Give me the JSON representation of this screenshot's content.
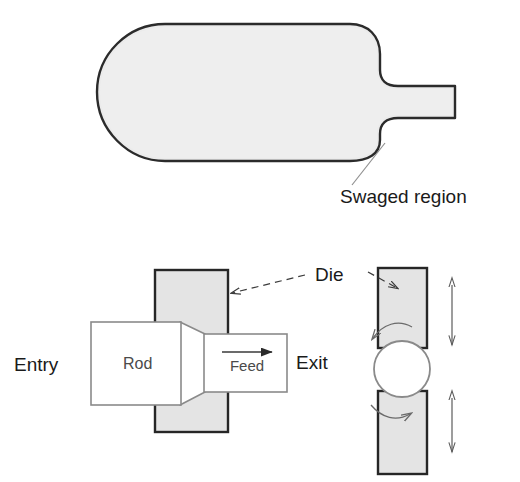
{
  "figure": {
    "colors": {
      "workpiece_fill": "#ebebeb",
      "workpiece_stroke": "#2b2b2b",
      "die_fill": "#e4e4e4",
      "die_stroke": "#262626",
      "rod_fill": "#ffffff",
      "rod_stroke": "#8a8a8a",
      "leader_line": "#8e8e8e",
      "text": "#1a1a1a",
      "background": "#ffffff"
    }
  },
  "top_figure": {
    "name": "swaged-workpiece",
    "labels": {
      "swaged_region": "Swaged region"
    }
  },
  "bottom_left_figure": {
    "name": "side-view-swaging",
    "labels": {
      "entry": "Entry",
      "rod": "Rod",
      "feed": "Feed",
      "exit": "Exit",
      "die": "Die"
    }
  },
  "bottom_right_figure": {
    "name": "end-view-swaging",
    "labels": {
      "die": "Die"
    },
    "annotations": {
      "rotation_arrow_top": "rotation-arrow",
      "rotation_arrow_bottom": "rotation-arrow",
      "stroke_arrow_top": "double-headed-vertical-arrow",
      "stroke_arrow_bottom": "double-headed-vertical-arrow"
    }
  }
}
